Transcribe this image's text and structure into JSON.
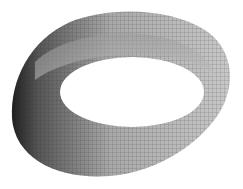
{
  "figure": {
    "style": "grayscale shaded surface with grid mesh",
    "background": "#ffffff",
    "colors": {
      "surface_light": "#b8b8b8",
      "surface_mid": "#8a8a8a",
      "surface_dark": "#2a2a2a",
      "grid": "#333333"
    }
  }
}
